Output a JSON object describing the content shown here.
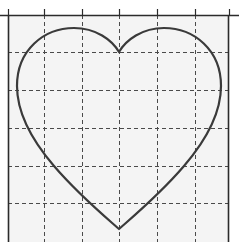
{
  "figure": {
    "title": "",
    "background_color": "#ffffff",
    "plot_background_color": "#f4f4f4",
    "axis_color": "#2b2b2b",
    "grid_color": "#4a4a4a",
    "curve_color": "#3a3a3a"
  },
  "axes": {
    "plot_left": 8,
    "plot_top": 15,
    "plot_right": 229,
    "plot_bottom": 242,
    "grid": "on",
    "grid_style": "dashed",
    "xlabel": "",
    "ylabel": "",
    "xtick_labels": [],
    "ytick_labels": [],
    "x_gridlines": [
      44,
      82,
      119,
      157,
      195
    ],
    "y_gridlines": [
      52,
      90,
      128,
      166,
      203
    ],
    "x_ticks_top": [
      8,
      44,
      82,
      119,
      157,
      195,
      229
    ],
    "tick_length": 6
  },
  "chart_data": {
    "type": "line",
    "title": "",
    "xlabel": "",
    "ylabel": "",
    "grid": "on",
    "legend": "none",
    "xlim": [
      8,
      229
    ],
    "ylim": [
      242,
      15
    ],
    "series": [
      {
        "name": "heart-curve",
        "closed": true,
        "color": "#3a3a3a",
        "linewidth": 2.2,
        "description": "Closed heart-shaped curve centered at x=119, cusp at top center (119,52), bottom tip at (119,229), left extreme x=17, right extreme x=220, lobe peaks at (68,30) and (170,30)",
        "key_points": {
          "top_cleft": [
            119,
            52
          ],
          "left_lobe_peak": [
            68,
            30
          ],
          "right_lobe_peak": [
            170,
            30
          ],
          "left_extreme": [
            17,
            98
          ],
          "right_extreme": [
            220,
            98
          ],
          "bottom_tip": [
            119,
            229
          ]
        },
        "path": "M 119 52 C 112 40 96 28 74 28 C 44 28 17 50 17 86 C 17 112 30 138 54 166 C 78 194 102 214 119 229 C 136 214 160 194 184 166 C 208 138 221 112 221 86 C 221 50 194 28 164 28 C 142 28 126 40 119 52 Z"
      }
    ]
  }
}
